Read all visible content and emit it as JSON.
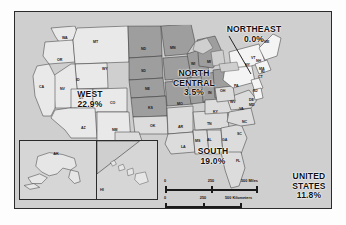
{
  "figure": {
    "type": "choropleth-region-map"
  },
  "regions": [
    {
      "id": "west",
      "name": "WEST",
      "value": "22.9%",
      "shade": "#e8e8e8"
    },
    {
      "id": "north_central",
      "name": "NORTH CENTRAL",
      "value": "3.5%",
      "shade": "#9e9e9e"
    },
    {
      "id": "northeast",
      "name": "NORTHEAST",
      "value": "0.0%",
      "shade": "#f4f4f4"
    },
    {
      "id": "south",
      "name": "SOUTH",
      "value": "19.0%",
      "shade": "#dcdcdc"
    },
    {
      "id": "united_states",
      "name_line1": "UNITED",
      "name_line2": "STATES",
      "value": "11.8%"
    }
  ],
  "region_labels": {
    "west": {
      "name": "WEST",
      "value": "22.9%"
    },
    "north_central": {
      "name_line1": "NORTH",
      "name_line2": "CENTRAL",
      "value": "3.5%"
    },
    "northeast": {
      "name": "NORTHEAST",
      "value": "0.0%"
    },
    "south": {
      "name": "SOUTH",
      "value": "19.0%"
    },
    "united_states": {
      "name_line1": "UNITED",
      "name_line2": "STATES",
      "value": "11.8%"
    }
  },
  "states": [
    {
      "abbr": "WA",
      "x": 47,
      "y": 24
    },
    {
      "abbr": "OR",
      "x": 42,
      "y": 46
    },
    {
      "abbr": "CA",
      "x": 24,
      "y": 73
    },
    {
      "abbr": "NV",
      "x": 45,
      "y": 75
    },
    {
      "abbr": "ID",
      "x": 61,
      "y": 66
    },
    {
      "abbr": "MT",
      "x": 78,
      "y": 28
    },
    {
      "abbr": "WY",
      "x": 87,
      "y": 55
    },
    {
      "abbr": "UT",
      "x": 64,
      "y": 84
    },
    {
      "abbr": "CO",
      "x": 95,
      "y": 89
    },
    {
      "abbr": "AZ",
      "x": 66,
      "y": 114
    },
    {
      "abbr": "NM",
      "x": 97,
      "y": 116
    },
    {
      "abbr": "ND",
      "x": 126,
      "y": 35
    },
    {
      "abbr": "SD",
      "x": 126,
      "y": 57
    },
    {
      "abbr": "NE",
      "x": 130,
      "y": 75
    },
    {
      "abbr": "KS",
      "x": 133,
      "y": 94
    },
    {
      "abbr": "OK",
      "x": 135,
      "y": 112
    },
    {
      "abbr": "TX",
      "x": 125,
      "y": 130
    },
    {
      "abbr": "MN",
      "x": 155,
      "y": 34
    },
    {
      "abbr": "IA",
      "x": 157,
      "y": 68
    },
    {
      "abbr": "MO",
      "x": 162,
      "y": 90
    },
    {
      "abbr": "AR",
      "x": 163,
      "y": 113
    },
    {
      "abbr": "LA",
      "x": 166,
      "y": 133
    },
    {
      "abbr": "WI",
      "x": 176,
      "y": 50
    },
    {
      "abbr": "IL",
      "x": 178,
      "y": 78
    },
    {
      "abbr": "MS",
      "x": 180,
      "y": 127
    },
    {
      "abbr": "AL",
      "x": 192,
      "y": 126
    },
    {
      "abbr": "MI",
      "x": 192,
      "y": 48
    },
    {
      "abbr": "IN",
      "x": 193,
      "y": 79
    },
    {
      "abbr": "KY",
      "x": 198,
      "y": 98
    },
    {
      "abbr": "TN",
      "x": 192,
      "y": 110
    },
    {
      "abbr": "OH",
      "x": 205,
      "y": 77
    },
    {
      "abbr": "GA",
      "x": 207,
      "y": 126
    },
    {
      "abbr": "FL",
      "x": 221,
      "y": 147
    },
    {
      "abbr": "WV",
      "x": 215,
      "y": 88
    },
    {
      "abbr": "PA",
      "x": 219,
      "y": 72
    },
    {
      "abbr": "VA",
      "x": 224,
      "y": 95
    },
    {
      "abbr": "NC",
      "x": 227,
      "y": 108
    },
    {
      "abbr": "SC",
      "x": 222,
      "y": 120
    },
    {
      "abbr": "NY",
      "x": 230,
      "y": 51
    },
    {
      "abbr": "MD",
      "x": 234,
      "y": 91
    },
    {
      "abbr": "DE",
      "x": 234,
      "y": 86
    },
    {
      "abbr": "NJ",
      "x": 238,
      "y": 77
    },
    {
      "abbr": "CT",
      "x": 243,
      "y": 63
    },
    {
      "abbr": "RI",
      "x": 246,
      "y": 58
    },
    {
      "abbr": "MA",
      "x": 244,
      "y": 55
    },
    {
      "abbr": "NH",
      "x": 241,
      "y": 47
    },
    {
      "abbr": "VT",
      "x": 236,
      "y": 44
    },
    {
      "abbr": "ME",
      "x": 249,
      "y": 28
    }
  ],
  "insets": {
    "alaska": {
      "abbr": "AK"
    },
    "hawaii": {
      "abbr": "HI"
    }
  },
  "scale": {
    "miles": {
      "ticks": [
        "0",
        "250"
      ],
      "unit_label": "500 Miles"
    },
    "kilometers": {
      "ticks": [
        "0",
        "250"
      ],
      "unit_label": "500 Kilometers"
    }
  }
}
